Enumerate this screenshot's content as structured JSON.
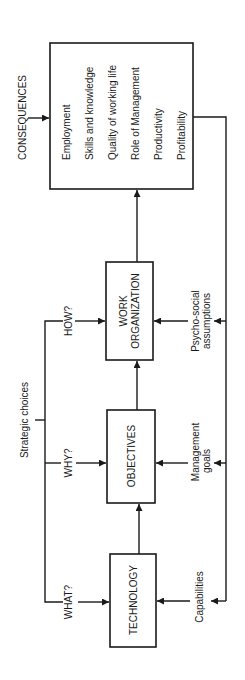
{
  "diagram": {
    "consequences": {
      "label": "CONSEQUENCES",
      "items": [
        "Employment",
        "Skills and knowledge",
        "Quality of working life",
        "Role of Management",
        "Productivity",
        "Profitability"
      ]
    },
    "strategic_choices": {
      "label": "Strategic choices",
      "branches": [
        "HOW?",
        "WHY?",
        "WHAT?"
      ]
    },
    "boxes": {
      "work_organization": [
        "WORK",
        "ORGANIZATION"
      ],
      "objectives": "OBJECTIVES",
      "technology": "TECHNOLOGY"
    },
    "inputs": {
      "psycho_social": [
        "Psycho-social",
        "assumptions"
      ],
      "management_goals": [
        "Management",
        "goals"
      ],
      "capabilities": "Capabilities"
    },
    "colors": {
      "line": "#1a1a1a",
      "background": "#ffffff"
    }
  }
}
